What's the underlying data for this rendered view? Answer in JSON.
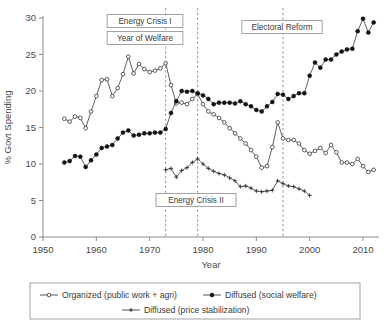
{
  "chart_data": {
    "type": "line",
    "title": "",
    "xlabel": "Year",
    "ylabel": "% Govt Spending",
    "xlim": [
      1950,
      2013
    ],
    "ylim": [
      0,
      30
    ],
    "xticks": [
      1950,
      1960,
      1970,
      1980,
      1990,
      2000,
      2010
    ],
    "yticks": [
      0,
      5,
      10,
      15,
      20,
      25,
      30
    ],
    "grid": false,
    "legend_position": "bottom",
    "series": [
      {
        "name": "Organized (public work + agri)",
        "marker": "open-circle",
        "x": [
          1954,
          1955,
          1956,
          1957,
          1958,
          1959,
          1960,
          1961,
          1962,
          1963,
          1964,
          1965,
          1966,
          1967,
          1968,
          1969,
          1970,
          1971,
          1972,
          1973,
          1974,
          1975,
          1976,
          1977,
          1978,
          1979,
          1980,
          1981,
          1982,
          1983,
          1984,
          1985,
          1986,
          1987,
          1988,
          1989,
          1990,
          1991,
          1992,
          1993,
          1994,
          1995,
          1996,
          1997,
          1998,
          1999,
          2000,
          2001,
          2002,
          2003,
          2004,
          2005,
          2006,
          2007,
          2008,
          2009,
          2010,
          2011,
          2012
        ],
        "values": [
          16.2,
          15.8,
          16.5,
          16.3,
          14.9,
          17.2,
          19.3,
          21.5,
          21.6,
          19.3,
          20.4,
          22.3,
          24.7,
          22.4,
          23.7,
          23.0,
          22.6,
          22.8,
          23.1,
          23.8,
          20.8,
          18.3,
          18.4,
          18.2,
          18.9,
          19.6,
          18.2,
          17.2,
          16.8,
          16.3,
          15.7,
          14.9,
          14.2,
          13.5,
          12.8,
          11.9,
          11.0,
          9.5,
          9.7,
          12.3,
          15.7,
          13.5,
          13.3,
          13.3,
          12.8,
          11.9,
          11.4,
          11.8,
          12.2,
          11.5,
          12.6,
          11.6,
          10.2,
          10.2,
          10.0,
          10.7,
          9.7,
          8.9,
          9.2
        ]
      },
      {
        "name": "Diffused (social welfare)",
        "marker": "filled-circle",
        "x": [
          1954,
          1955,
          1956,
          1957,
          1958,
          1959,
          1960,
          1961,
          1962,
          1963,
          1964,
          1965,
          1966,
          1967,
          1968,
          1969,
          1970,
          1971,
          1972,
          1973,
          1974,
          1975,
          1976,
          1977,
          1978,
          1979,
          1980,
          1981,
          1982,
          1983,
          1984,
          1985,
          1986,
          1987,
          1988,
          1989,
          1990,
          1991,
          1992,
          1993,
          1994,
          1995,
          1996,
          1997,
          1998,
          1999,
          2000,
          2001,
          2002,
          2003,
          2004,
          2005,
          2006,
          2007,
          2008,
          2009,
          2010,
          2011,
          2012
        ],
        "values": [
          10.2,
          10.4,
          11.1,
          11.0,
          9.6,
          10.5,
          11.3,
          12.2,
          12.4,
          12.6,
          13.5,
          14.3,
          14.6,
          13.9,
          14.0,
          14.2,
          14.2,
          14.3,
          14.3,
          14.8,
          17.0,
          18.6,
          20.0,
          19.9,
          20.0,
          19.7,
          19.4,
          18.9,
          18.2,
          18.4,
          18.4,
          18.4,
          18.3,
          18.6,
          18.2,
          17.9,
          17.4,
          17.2,
          17.9,
          18.5,
          19.6,
          19.5,
          18.9,
          19.3,
          19.7,
          19.7,
          22.1,
          23.9,
          23.2,
          24.3,
          24.3,
          25.0,
          25.4,
          25.7,
          25.8,
          28.2,
          29.9,
          28.0,
          29.4
        ]
      },
      {
        "name": "Diffused (price stabilization)",
        "marker": "plus",
        "x": [
          1973,
          1974,
          1975,
          1976,
          1977,
          1978,
          1979,
          1980,
          1981,
          1982,
          1983,
          1984,
          1985,
          1986,
          1987,
          1988,
          1989,
          1990,
          1991,
          1992,
          1993,
          1994,
          1995,
          1996,
          1997,
          1998,
          1999,
          2000
        ],
        "values": [
          9.2,
          9.4,
          8.2,
          9.1,
          9.5,
          10.2,
          10.7,
          10.0,
          9.4,
          9.0,
          8.7,
          8.5,
          8.1,
          7.7,
          6.9,
          7.0,
          6.7,
          6.3,
          6.2,
          6.3,
          6.4,
          7.7,
          7.3,
          7.0,
          6.9,
          6.6,
          6.3,
          5.7
        ]
      }
    ],
    "annotations": [
      {
        "label": "Energy Crisis I",
        "x": 1973,
        "box_cx": 145,
        "box_cy": 21
      },
      {
        "label": "Year of Welfare",
        "x": 1973,
        "box_cx": 145,
        "box_cy": 38
      },
      {
        "label": "Energy Crisis II",
        "x": 1979,
        "box_cx": 196,
        "box_cy": 200
      },
      {
        "label": "Electoral Reform",
        "x": 1995,
        "box_cx": 282,
        "box_cy": 27
      }
    ],
    "vlines": [
      1973,
      1979,
      1995
    ]
  },
  "legend": {
    "entries": [
      {
        "label": "Organized (public work + agri)",
        "marker": "open-circle"
      },
      {
        "label": "Diffused (social welfare)",
        "marker": "filled-circle"
      },
      {
        "label": "Diffused (price stabilization)",
        "marker": "plus"
      }
    ]
  },
  "colors": {
    "line": "#2a2a2a",
    "axis": "#808080",
    "text": "#3a3a3a",
    "vline": "#8a8a8a",
    "marker_fill_open": "#ffffff",
    "marker_fill_solid": "#111111"
  }
}
